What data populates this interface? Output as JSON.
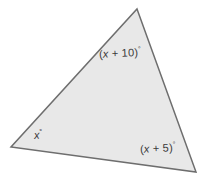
{
  "figure": {
    "name": "triangle-angle-diagram",
    "background_color": "#ffffff",
    "shape": {
      "type": "triangle",
      "fill_color": "#e8e8e8",
      "stroke_color": "#6e6e6e",
      "stroke_width": 1.5,
      "vertices": [
        {
          "name": "top-vertex",
          "x": 137,
          "y": 9
        },
        {
          "name": "bottom-right-vertex",
          "x": 196,
          "y": 172
        },
        {
          "name": "bottom-left-vertex",
          "x": 11,
          "y": 147
        }
      ]
    },
    "labels": {
      "top": {
        "open_paren": "(",
        "variable": "x",
        "operator": " + ",
        "constant": "10",
        "close_paren": ")",
        "degree": "°",
        "full_text": "(x + 10)°"
      },
      "bottom_right": {
        "open_paren": "(",
        "variable": "x",
        "operator": " + ",
        "constant": "5",
        "close_paren": ")",
        "degree": "°",
        "full_text": "(x + 5)°"
      },
      "bottom_left": {
        "variable": "x",
        "degree": "°",
        "full_text": "x°"
      }
    },
    "text_color": "#3a3a3a"
  }
}
